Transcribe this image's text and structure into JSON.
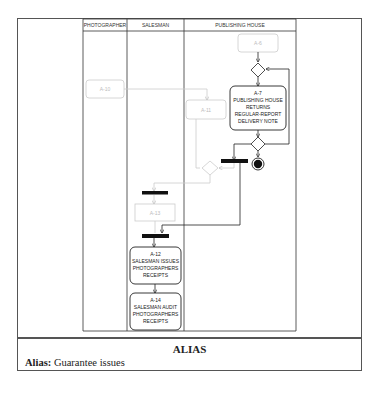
{
  "diagram": {
    "type": "uml-activity-diagram-swimlanes",
    "lanes": [
      {
        "name": "PHOTOGRAPHER"
      },
      {
        "name": "SALESMAN"
      },
      {
        "name": "PUBLISHING HOUSE"
      }
    ],
    "nodes": {
      "a6": {
        "label": "A-6",
        "lane": "PUBLISHING HOUSE",
        "style": "faint"
      },
      "a7": {
        "id": "A-7",
        "text": [
          "PUBLISHING HOUSE",
          "RETURNS",
          "REGULAR-REPORT",
          "DELIVERY NOTE"
        ],
        "lane": "PUBLISHING HOUSE"
      },
      "a10": {
        "label": "A-10",
        "lane": "PHOTOGRAPHER",
        "style": "faint"
      },
      "a11": {
        "label": "A-11",
        "lane": "PUBLISHING HOUSE",
        "style": "faint"
      },
      "a13": {
        "label": "A-13",
        "lane": "SALESMAN",
        "style": "faint"
      },
      "a12": {
        "id": "A-12",
        "text": [
          "SALESMAN ISSUES",
          "PHOTOGRAPHERS",
          "RECEIPTS"
        ],
        "lane": "SALESMAN"
      },
      "a14": {
        "id": "A-14",
        "text": [
          "SALESMAN AUDIT",
          "PHOTOGRAPHERS",
          "RECEIPTS"
        ],
        "lane": "SALESMAN"
      }
    }
  },
  "alias": {
    "title": "ALIAS",
    "label": "Alias:",
    "value": "Guarantee issues"
  }
}
